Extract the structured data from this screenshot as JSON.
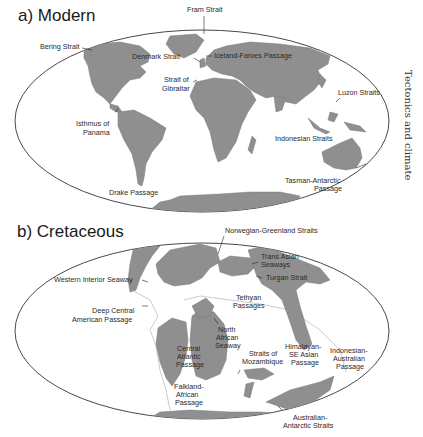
{
  "figure": {
    "side_label": "Tectonics and climate",
    "colors": {
      "land": "#8f8f8f",
      "ocean": "#ffffff",
      "frame": "#333333",
      "shelf": "#b5b5b5"
    }
  },
  "panels": [
    {
      "id": "a",
      "title": "a) Modern",
      "labels": [
        {
          "text": "Fram Strait"
        },
        {
          "text": "Bering Strait"
        },
        {
          "text": "Denmark Strait"
        },
        {
          "text": "Iceland-Faroes Passage"
        },
        {
          "text": "Strait of"
        },
        {
          "text": "Gibraltar"
        },
        {
          "text": "Luzon Straits"
        },
        {
          "text": "Isthmus of"
        },
        {
          "text": "Panama"
        },
        {
          "text": "Indonesian Straits"
        },
        {
          "text": "Tasman-Antarctic"
        },
        {
          "text": "Passage"
        },
        {
          "text": "Drake Passage"
        }
      ]
    },
    {
      "id": "b",
      "title": "b) Cretaceous",
      "labels": [
        {
          "text": "Norwegian-Greenland Straits"
        },
        {
          "text": "Trans Asian"
        },
        {
          "text": "Seaways"
        },
        {
          "text": "Western Interior Seaway"
        },
        {
          "text": "Turgan Strait"
        },
        {
          "text": "Tethyan"
        },
        {
          "text": "Passages"
        },
        {
          "text": "Deep Central"
        },
        {
          "text": "American Passage"
        },
        {
          "text": "North"
        },
        {
          "text": "African"
        },
        {
          "text": "Seaway"
        },
        {
          "text": "Central"
        },
        {
          "text": "Atlantic"
        },
        {
          "text": "Passage"
        },
        {
          "text": "Straits of"
        },
        {
          "text": "Mozambique"
        },
        {
          "text": "Himalayan-"
        },
        {
          "text": "SE Asian"
        },
        {
          "text": "Passage"
        },
        {
          "text": "Indonesian-"
        },
        {
          "text": "Australian"
        },
        {
          "text": "Passage"
        },
        {
          "text": "Falkland-"
        },
        {
          "text": "African"
        },
        {
          "text": "Passage"
        },
        {
          "text": "Australian-"
        },
        {
          "text": "Antarctic Straits"
        }
      ]
    }
  ]
}
